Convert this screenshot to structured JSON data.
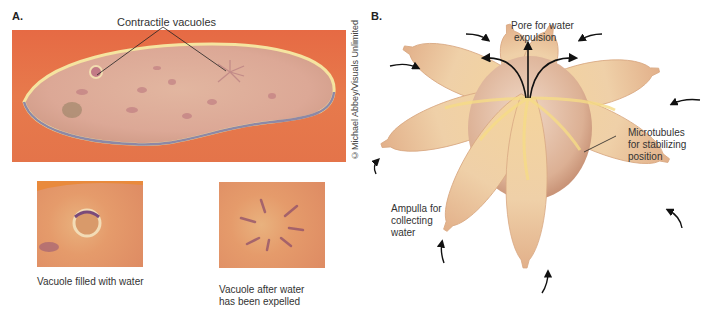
{
  "panel_a": {
    "label": "A.",
    "callout": "Contractile vacuoles",
    "credit": "©Michael Abbey/Visuals Unlimited",
    "insets": [
      {
        "caption": "Vacuole filled with water"
      },
      {
        "caption_line1": "Vacuole after water",
        "caption_line2": "has been expelled"
      }
    ]
  },
  "panel_b": {
    "label": "B.",
    "labels": {
      "pore_line1": "Pore for water",
      "pore_line2": "expulsion",
      "microtubules_line1": "Microtubules",
      "microtubules_line2": "for stabilizing",
      "microtubules_line3": "position",
      "ampulla_line1": "Ampulla for",
      "ampulla_line2": "collecting",
      "ampulla_line3": "water"
    }
  },
  "colors": {
    "photo_background": "#e66a44",
    "cell_body": "#e2bfa0",
    "ampulla": "#f2cf96",
    "vacuole_body": "#e6c2a6",
    "arrow": "#111111"
  }
}
